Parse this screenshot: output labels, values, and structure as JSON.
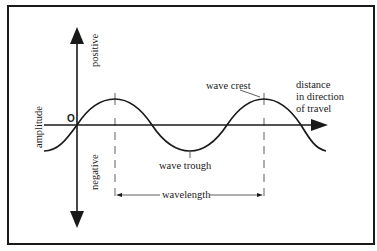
{
  "diagram": {
    "axes": {
      "vertical_label": "amplitude",
      "positive_label": "positive",
      "negative_label": "negative",
      "origin_label": "O",
      "horizontal_label_lines": [
        "distance",
        "in direction",
        "of travel"
      ]
    },
    "labels": {
      "wave_crest": "wave crest",
      "wave_trough": "wave trough",
      "wavelength": "wavelength"
    },
    "colors": {
      "line": "#1a1a1a",
      "background": "#ffffff"
    }
  }
}
